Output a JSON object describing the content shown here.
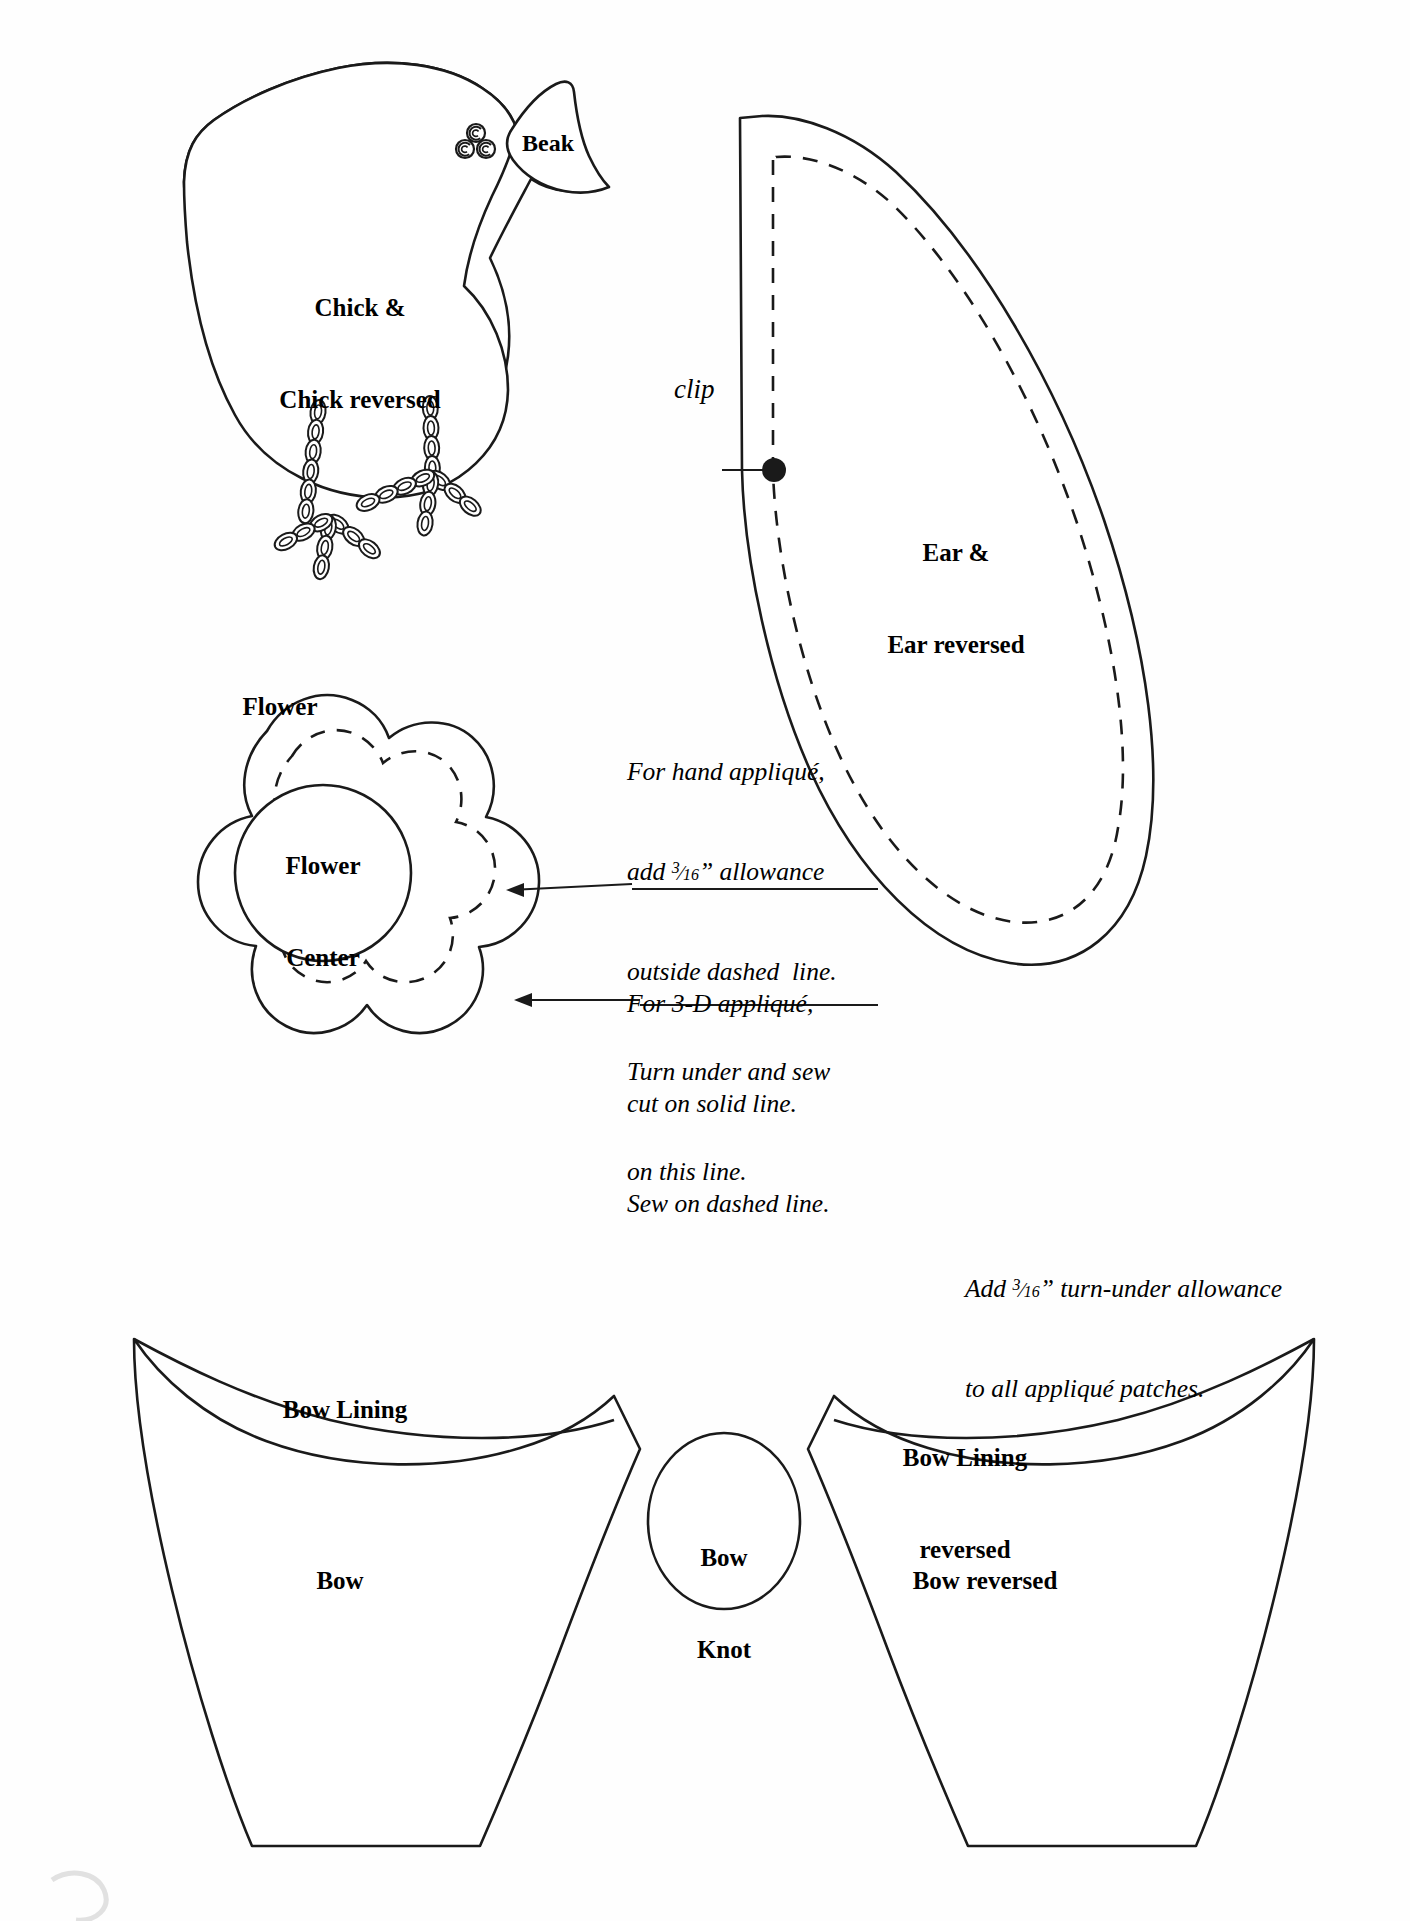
{
  "document": {
    "kind": "applique-pattern-sheet",
    "background_color": "#ffffff",
    "line_color": "#1a1a1a"
  },
  "pieces": {
    "chick": {
      "label": "Chick &\nChick reversed",
      "label_line1": "Chick &",
      "label_line2": "Chick reversed",
      "beak_label": "Beak",
      "eye_icon": "french-knot-eye-icon",
      "legs_icon": "chain-stitch-legs-icon"
    },
    "ear": {
      "label": "Ear &\nEar reversed",
      "label_line1": "Ear &",
      "label_line2": "Ear reversed",
      "clip_label": "clip",
      "clip_marker_icon": "clip-dot-icon"
    },
    "flower": {
      "label": "Flower",
      "center_label_line1": "Flower",
      "center_label_line2": "Center",
      "center_label": "Flower\nCenter"
    },
    "bow": {
      "lining_label": "Bow Lining",
      "lining_reversed_label_line1": "Bow Lining",
      "lining_reversed_label_line2": "reversed",
      "knot_label_line1": "Bow",
      "knot_label_line2": "Knot",
      "left_label": "Bow",
      "right_label": "Bow reversed"
    }
  },
  "notes": {
    "hand_applique": {
      "line1": "For hand appliqué,",
      "line2_pre": "add ",
      "line2_frac_num": "3",
      "line2_frac_den": "16",
      "line2_post": "” allowance",
      "line3": "outside dashed  line.",
      "line4": "Turn under and sew",
      "line5": "on this line."
    },
    "three_d_applique": {
      "line1": "For 3-D appliqué,",
      "line2": "cut on solid line.",
      "line3": "Sew on dashed line."
    },
    "global_allowance": {
      "line1_pre": "Add ",
      "line1_frac_num": "3",
      "line1_frac_den": "16",
      "line1_post": "” turn-under allowance",
      "line2": "to all appliqué patches."
    }
  }
}
